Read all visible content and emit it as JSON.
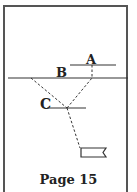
{
  "diagram": {
    "labels": {
      "a": "A",
      "b": "B",
      "c": "C"
    },
    "page_label": "Page 15",
    "colors": {
      "line": "#333333",
      "frame": "#555555",
      "text": "#222222"
    },
    "lines": [
      {
        "name": "line-a",
        "x1": 70,
        "y1": 65,
        "x2": 116,
        "y2": 65,
        "style": "solid"
      },
      {
        "name": "line-b",
        "x1": 8,
        "y1": 78,
        "x2": 128,
        "y2": 78,
        "style": "solid"
      },
      {
        "name": "line-c",
        "x1": 47,
        "y1": 108,
        "x2": 86,
        "y2": 108,
        "style": "solid"
      }
    ],
    "paths": [
      {
        "name": "path-a-to-c",
        "points": [
          [
            92,
            65
          ],
          [
            92,
            78
          ],
          [
            67,
            108
          ]
        ],
        "style": "dashed"
      },
      {
        "name": "path-b-to-c",
        "points": [
          [
            31,
            78
          ],
          [
            67,
            108
          ]
        ],
        "style": "dashed"
      },
      {
        "name": "path-c-to-flag",
        "points": [
          [
            67,
            108
          ],
          [
            80,
            148
          ]
        ],
        "style": "dashed"
      }
    ],
    "flag": {
      "x": 81,
      "y": 148,
      "width": 25,
      "height": 9
    }
  }
}
